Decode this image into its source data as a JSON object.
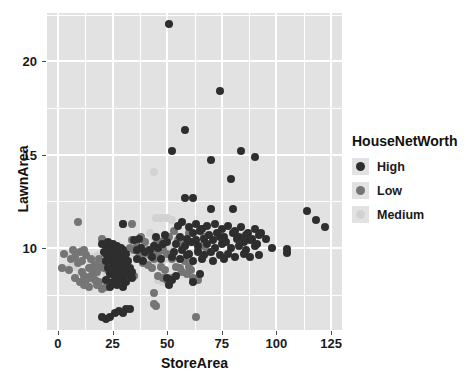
{
  "chart_data": {
    "type": "scatter",
    "title": "",
    "xlabel": "StoreArea",
    "ylabel": "LawnArea",
    "xlim": [
      -5,
      130
    ],
    "xticks": [
      0,
      25,
      50,
      75,
      100,
      125
    ],
    "ylim": [
      5.6,
      22.6
    ],
    "yticks": [
      10,
      15,
      20
    ],
    "grid": true,
    "legend": {
      "title": "HouseNetWorth",
      "position": "right",
      "entries": [
        {
          "label": "High",
          "color": "#2e2e2e"
        },
        {
          "label": "Low",
          "color": "#757575"
        },
        {
          "label": "Medium",
          "color": "#d2d2d2"
        }
      ]
    },
    "series": [
      {
        "name": "High",
        "color": "#2e2e2e",
        "points": [
          [
            51,
            22.0
          ],
          [
            74,
            18.4
          ],
          [
            58,
            16.3
          ],
          [
            52,
            15.2
          ],
          [
            84,
            15.2
          ],
          [
            90,
            14.9
          ],
          [
            70,
            14.7
          ],
          [
            79,
            13.7
          ],
          [
            58,
            12.7
          ],
          [
            62,
            12.7
          ],
          [
            70,
            12.1
          ],
          [
            80,
            12.1
          ],
          [
            114,
            12.0
          ],
          [
            118,
            11.5
          ],
          [
            122,
            11.1
          ],
          [
            30,
            11.3
          ],
          [
            57,
            11.4
          ],
          [
            55,
            11.2
          ],
          [
            60,
            11.1
          ],
          [
            63,
            11.3
          ],
          [
            66,
            11.0
          ],
          [
            68,
            11.2
          ],
          [
            72,
            11.3
          ],
          [
            75,
            11.0
          ],
          [
            78,
            11.2
          ],
          [
            81,
            10.9
          ],
          [
            84,
            11.1
          ],
          [
            87,
            10.8
          ],
          [
            90,
            11.0
          ],
          [
            93,
            10.8
          ],
          [
            62,
            10.8
          ],
          [
            65,
            10.9
          ],
          [
            69,
            10.7
          ],
          [
            73,
            10.8
          ],
          [
            76,
            10.6
          ],
          [
            80,
            10.8
          ],
          [
            83,
            10.6
          ],
          [
            86,
            10.7
          ],
          [
            89,
            10.5
          ],
          [
            92,
            10.7
          ],
          [
            56,
            10.6
          ],
          [
            59,
            10.5
          ],
          [
            63,
            10.4
          ],
          [
            67,
            10.5
          ],
          [
            71,
            10.4
          ],
          [
            74,
            10.6
          ],
          [
            77,
            10.3
          ],
          [
            82,
            10.5
          ],
          [
            85,
            10.3
          ],
          [
            88,
            10.4
          ],
          [
            91,
            10.2
          ],
          [
            95,
            10.5
          ],
          [
            54,
            10.2
          ],
          [
            58,
            10.1
          ],
          [
            61,
            10.3
          ],
          [
            64,
            10.1
          ],
          [
            68,
            10.2
          ],
          [
            72,
            10.0
          ],
          [
            75,
            10.2
          ],
          [
            79,
            10.0
          ],
          [
            83,
            10.1
          ],
          [
            86,
            9.9
          ],
          [
            90,
            10.1
          ],
          [
            98,
            10.0
          ],
          [
            105,
            9.95
          ],
          [
            105,
            9.75
          ],
          [
            53,
            9.8
          ],
          [
            57,
            9.9
          ],
          [
            60,
            9.7
          ],
          [
            64,
            9.8
          ],
          [
            67,
            9.6
          ],
          [
            70,
            9.8
          ],
          [
            74,
            9.6
          ],
          [
            78,
            9.7
          ],
          [
            81,
            9.5
          ],
          [
            85,
            9.7
          ],
          [
            88,
            9.5
          ],
          [
            92,
            9.6
          ],
          [
            52,
            9.5
          ],
          [
            56,
            9.4
          ],
          [
            59,
            9.6
          ],
          [
            62,
            9.3
          ],
          [
            66,
            9.4
          ],
          [
            71,
            9.3
          ],
          [
            76,
            9.4
          ],
          [
            20,
            10.2
          ],
          [
            22,
            10.1
          ],
          [
            23,
            10.3
          ],
          [
            24,
            10.0
          ],
          [
            25,
            10.2
          ],
          [
            26,
            9.9
          ],
          [
            27,
            10.1
          ],
          [
            28,
            9.8
          ],
          [
            29,
            10.0
          ],
          [
            30,
            9.9
          ],
          [
            21,
            9.8
          ],
          [
            22,
            9.7
          ],
          [
            24,
            9.6
          ],
          [
            25,
            9.8
          ],
          [
            26,
            9.5
          ],
          [
            27,
            9.7
          ],
          [
            28,
            9.4
          ],
          [
            29,
            9.6
          ],
          [
            30,
            9.5
          ],
          [
            31,
            9.7
          ],
          [
            22,
            9.3
          ],
          [
            23,
            9.4
          ],
          [
            25,
            9.2
          ],
          [
            26,
            9.3
          ],
          [
            27,
            9.1
          ],
          [
            28,
            9.3
          ],
          [
            29,
            9.0
          ],
          [
            30,
            9.2
          ],
          [
            31,
            9.1
          ],
          [
            32,
            9.3
          ],
          [
            23,
            8.9
          ],
          [
            25,
            8.8
          ],
          [
            27,
            8.9
          ],
          [
            29,
            8.7
          ],
          [
            31,
            8.8
          ],
          [
            33,
            8.9
          ],
          [
            24,
            8.6
          ],
          [
            26,
            8.5
          ],
          [
            28,
            8.6
          ],
          [
            30,
            8.4
          ],
          [
            32,
            8.6
          ],
          [
            34,
            8.7
          ],
          [
            22,
            8.3
          ],
          [
            25,
            8.2
          ],
          [
            28,
            8.3
          ],
          [
            31,
            8.2
          ],
          [
            34,
            8.4
          ],
          [
            24,
            7.9
          ],
          [
            27,
            8.0
          ],
          [
            30,
            7.9
          ],
          [
            20,
            6.3
          ],
          [
            22,
            6.2
          ],
          [
            24,
            6.3
          ],
          [
            26,
            6.5
          ],
          [
            28,
            6.6
          ],
          [
            30,
            6.5
          ],
          [
            31,
            6.7
          ],
          [
            33,
            6.7
          ],
          [
            50,
            8.4
          ],
          [
            52,
            8.3
          ],
          [
            54,
            8.5
          ],
          [
            65,
            8.6
          ],
          [
            62,
            8.2
          ],
          [
            51,
            8.0
          ],
          [
            36,
            9.9
          ],
          [
            38,
            10.0
          ],
          [
            40,
            9.8
          ],
          [
            42,
            9.9
          ],
          [
            44,
            10.1
          ],
          [
            46,
            10.0
          ],
          [
            48,
            10.2
          ],
          [
            50,
            10.3
          ],
          [
            36,
            9.4
          ],
          [
            39,
            9.3
          ],
          [
            43,
            9.5
          ],
          [
            47,
            9.4
          ],
          [
            35,
            10.4
          ],
          [
            37,
            10.5
          ],
          [
            45,
            10.6
          ],
          [
            49,
            10.7
          ]
        ]
      },
      {
        "name": "Low",
        "color": "#757575",
        "points": [
          [
            9,
            11.4
          ],
          [
            3,
            9.7
          ],
          [
            2,
            8.9
          ],
          [
            5,
            8.8
          ],
          [
            7,
            9.9
          ],
          [
            8,
            9.5
          ],
          [
            10,
            9.8
          ],
          [
            11,
            9.3
          ],
          [
            12,
            9.9
          ],
          [
            13,
            9.6
          ],
          [
            14,
            8.9
          ],
          [
            15,
            9.4
          ],
          [
            16,
            8.6
          ],
          [
            17,
            9.1
          ],
          [
            18,
            8.7
          ],
          [
            19,
            9.4
          ],
          [
            20,
            10.5
          ],
          [
            12,
            8.5
          ],
          [
            14,
            8.4
          ],
          [
            16,
            9.0
          ],
          [
            6,
            9.4
          ],
          [
            9,
            9.2
          ],
          [
            11,
            8.7
          ],
          [
            13,
            8.3
          ],
          [
            15,
            8.5
          ],
          [
            17,
            8.3
          ],
          [
            19,
            8.2
          ],
          [
            21,
            8.9
          ],
          [
            23,
            9.9
          ],
          [
            25,
            10.0
          ],
          [
            33,
            10.0
          ],
          [
            35,
            9.9
          ],
          [
            37,
            9.8
          ],
          [
            39,
            9.7
          ],
          [
            41,
            9.9
          ],
          [
            43,
            9.8
          ],
          [
            45,
            10.2
          ],
          [
            47,
            10.3
          ],
          [
            49,
            10.4
          ],
          [
            42,
            9.6
          ],
          [
            44,
            9.4
          ],
          [
            46,
            9.7
          ],
          [
            48,
            9.9
          ],
          [
            40,
            10.3
          ],
          [
            38,
            10.6
          ],
          [
            36,
            10.1
          ],
          [
            34,
            10.4
          ],
          [
            51,
            10.6
          ],
          [
            53,
            10.9
          ],
          [
            55,
            10.4
          ],
          [
            57,
            10.2
          ],
          [
            50,
            9.7
          ],
          [
            52,
            9.4
          ],
          [
            54,
            9.0
          ],
          [
            56,
            8.9
          ],
          [
            58,
            9.3
          ],
          [
            60,
            9.0
          ],
          [
            33,
            8.8
          ],
          [
            35,
            8.5
          ],
          [
            31,
            8.4
          ],
          [
            29,
            8.2
          ],
          [
            27,
            8.3
          ],
          [
            24,
            8.1
          ],
          [
            22,
            7.9
          ],
          [
            20,
            7.8
          ],
          [
            18,
            8.0
          ],
          [
            46,
            8.5
          ],
          [
            48,
            8.4
          ],
          [
            50,
            8.3
          ],
          [
            52,
            8.4
          ],
          [
            62,
            8.4
          ],
          [
            64,
            8.3
          ],
          [
            63,
            6.3
          ],
          [
            44,
            7.0
          ],
          [
            45,
            6.9
          ],
          [
            44,
            7.6
          ],
          [
            34,
            11.3
          ],
          [
            30,
            11.3
          ],
          [
            60,
            10.8
          ],
          [
            62,
            10.3
          ],
          [
            64,
            9.9
          ],
          [
            66,
            10.1
          ],
          [
            68,
            9.8
          ],
          [
            19,
            9.0
          ],
          [
            21,
            9.2
          ],
          [
            23,
            8.8
          ],
          [
            26,
            8.7
          ],
          [
            10,
            8.2
          ],
          [
            8,
            8.4
          ],
          [
            12,
            8.0
          ],
          [
            14,
            7.9
          ],
          [
            61,
            8.8
          ],
          [
            59,
            8.6
          ],
          [
            57,
            8.7
          ],
          [
            49,
            8.8
          ],
          [
            47,
            9.0
          ],
          [
            43,
            8.9
          ],
          [
            41,
            9.1
          ],
          [
            39,
            9.2
          ],
          [
            65,
            11.0
          ],
          [
            67,
            10.6
          ]
        ]
      },
      {
        "name": "Medium",
        "color": "#d2d2d2",
        "points": [
          [
            44,
            14.1
          ],
          [
            45,
            11.6
          ],
          [
            47,
            11.6
          ],
          [
            42,
            10.8
          ],
          [
            44,
            10.6
          ],
          [
            46,
            10.4
          ],
          [
            48,
            10.5
          ],
          [
            40,
            10.2
          ],
          [
            42,
            10.0
          ],
          [
            44,
            9.9
          ],
          [
            46,
            9.8
          ],
          [
            48,
            9.7
          ],
          [
            38,
            9.9
          ],
          [
            36,
            10.0
          ],
          [
            50,
            9.9
          ],
          [
            52,
            10.1
          ],
          [
            43,
            9.5
          ],
          [
            45,
            9.3
          ],
          [
            47,
            9.2
          ],
          [
            49,
            9.4
          ],
          [
            41,
            9.4
          ],
          [
            39,
            9.6
          ],
          [
            37,
            9.5
          ],
          [
            35,
            9.7
          ],
          [
            33,
            9.8
          ],
          [
            31,
            9.9
          ],
          [
            29,
            10.0
          ],
          [
            27,
            10.1
          ],
          [
            25,
            10.2
          ],
          [
            23,
            10.0
          ],
          [
            21,
            9.8
          ],
          [
            19,
            9.6
          ],
          [
            17,
            9.5
          ],
          [
            15,
            9.3
          ],
          [
            13,
            9.7
          ],
          [
            11,
            9.9
          ],
          [
            9,
            9.4
          ],
          [
            7,
            9.2
          ],
          [
            5,
            8.9
          ],
          [
            44,
            7.0
          ],
          [
            45,
            6.9
          ],
          [
            46,
            8.3
          ],
          [
            48,
            8.2
          ],
          [
            50,
            8.4
          ],
          [
            20,
            8.9
          ],
          [
            22,
            8.7
          ],
          [
            24,
            8.5
          ],
          [
            26,
            8.6
          ],
          [
            28,
            8.8
          ],
          [
            30,
            8.9
          ],
          [
            32,
            8.7
          ],
          [
            16,
            8.8
          ],
          [
            18,
            8.6
          ],
          [
            12,
            8.5
          ],
          [
            10,
            8.7
          ],
          [
            14,
            8.3
          ],
          [
            8,
            9.0
          ],
          [
            6,
            9.6
          ],
          [
            50,
            11.6
          ],
          [
            52,
            11.5
          ]
        ]
      }
    ]
  }
}
